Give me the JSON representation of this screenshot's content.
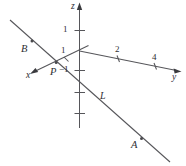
{
  "figure": {
    "kind": "3d-coordinate-axes-diagram",
    "width": 186,
    "height": 166,
    "background_color": "#ffffff",
    "stroke_color": "#56565a",
    "label_color": "#2e2e32"
  },
  "axes": [
    {
      "id": "z",
      "label": "z",
      "direction": "up",
      "has_arrow": true
    },
    {
      "id": "y",
      "label": "y",
      "direction": "right-down",
      "has_arrow": true
    },
    {
      "id": "x",
      "label": "x",
      "direction": "left-down",
      "has_arrow": true
    }
  ],
  "tick_labels": {
    "z_positive_1": "1",
    "z_negative_1": "−1",
    "x_axis_1": "1",
    "y_axis_2": "2",
    "y_axis_4": "4"
  },
  "points": [
    {
      "id": "B",
      "label": "B",
      "on_line": "L"
    },
    {
      "id": "P",
      "label": "P",
      "on_line": "L"
    },
    {
      "id": "A",
      "label": "A",
      "on_line": "L"
    }
  ],
  "lines": [
    {
      "id": "L",
      "label": "L",
      "through_points": [
        "B",
        "P",
        "A"
      ]
    }
  ],
  "all_labels": [
    "z",
    "1",
    "1",
    "2",
    "4",
    "y",
    "x",
    "−1",
    "B",
    "P",
    "L",
    "A"
  ]
}
